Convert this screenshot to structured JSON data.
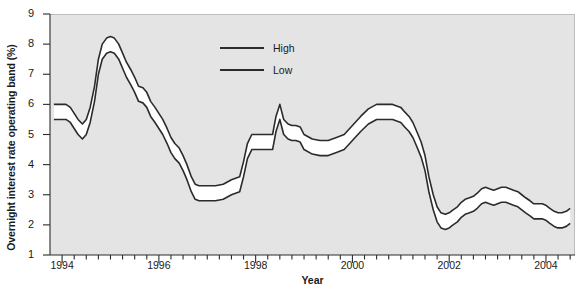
{
  "chart_data": {
    "type": "line",
    "title": "",
    "subtitle": "",
    "xlabel": "Year",
    "ylabel": "Overnight interest rate operating band (%)",
    "xlim": [
      1993.75,
      2004.6
    ],
    "ylim": [
      1,
      9
    ],
    "ytick_labels": [
      "9",
      "8",
      "7",
      "6",
      "5",
      "4",
      "3",
      "2",
      "1"
    ],
    "ytick_values": [
      9,
      8,
      7,
      6,
      5,
      4,
      3,
      2,
      1
    ],
    "xtick_labels": [
      "1994",
      "1996",
      "1998",
      "2000",
      "2002",
      "2004"
    ],
    "xtick_values": [
      1994,
      1996,
      1998,
      2000,
      2002,
      2004
    ],
    "minor_xtick_interval": 0.25,
    "grid": false,
    "legend_position": "upper-center-right",
    "band_fill": "#ffffff",
    "line_color": "#2b2b2b",
    "plot_background": "#e4e4e4",
    "legend": [
      {
        "name": "High",
        "label": "High"
      },
      {
        "name": "Low",
        "label": "Low"
      }
    ],
    "x": [
      1993.83,
      1994.0,
      1994.08,
      1994.17,
      1994.25,
      1994.33,
      1994.42,
      1994.5,
      1994.58,
      1994.67,
      1994.75,
      1994.83,
      1994.92,
      1995.0,
      1995.08,
      1995.17,
      1995.25,
      1995.33,
      1995.42,
      1995.5,
      1995.58,
      1995.67,
      1995.75,
      1995.83,
      1995.92,
      1996.0,
      1996.08,
      1996.17,
      1996.25,
      1996.33,
      1996.42,
      1996.5,
      1996.58,
      1996.67,
      1996.75,
      1996.83,
      1996.92,
      1997.0,
      1997.17,
      1997.33,
      1997.5,
      1997.67,
      1997.75,
      1997.83,
      1997.92,
      1998.0,
      1998.12,
      1998.2,
      1998.28,
      1998.35,
      1998.42,
      1998.5,
      1998.58,
      1998.67,
      1998.75,
      1998.83,
      1998.92,
      1999.0,
      1999.17,
      1999.33,
      1999.5,
      1999.67,
      1999.83,
      2000.0,
      2000.17,
      2000.33,
      2000.5,
      2000.67,
      2000.83,
      2001.0,
      2001.08,
      2001.17,
      2001.25,
      2001.33,
      2001.42,
      2001.5,
      2001.58,
      2001.67,
      2001.75,
      2001.83,
      2001.92,
      2002.0,
      2002.08,
      2002.17,
      2002.25,
      2002.33,
      2002.42,
      2002.5,
      2002.58,
      2002.67,
      2002.75,
      2002.83,
      2002.92,
      2003.0,
      2003.08,
      2003.17,
      2003.25,
      2003.33,
      2003.42,
      2003.5,
      2003.58,
      2003.67,
      2003.75,
      2003.83,
      2003.92,
      2004.0,
      2004.08,
      2004.17,
      2004.25,
      2004.33,
      2004.42,
      2004.5
    ],
    "series": [
      {
        "name": "High",
        "label": "High",
        "values": [
          6.0,
          6.0,
          6.0,
          5.9,
          5.7,
          5.5,
          5.35,
          5.5,
          5.9,
          6.6,
          7.5,
          8.0,
          8.2,
          8.25,
          8.2,
          8.0,
          7.7,
          7.4,
          7.15,
          6.9,
          6.6,
          6.55,
          6.4,
          6.1,
          5.9,
          5.7,
          5.5,
          5.2,
          4.9,
          4.7,
          4.55,
          4.3,
          4.0,
          3.6,
          3.35,
          3.3,
          3.3,
          3.3,
          3.3,
          3.35,
          3.5,
          3.6,
          4.1,
          4.7,
          5.0,
          5.0,
          5.0,
          5.0,
          5.0,
          5.0,
          5.6,
          6.0,
          5.5,
          5.35,
          5.3,
          5.3,
          5.25,
          5.0,
          4.85,
          4.8,
          4.8,
          4.9,
          5.0,
          5.3,
          5.6,
          5.85,
          6.0,
          6.0,
          6.0,
          5.9,
          5.75,
          5.6,
          5.4,
          5.1,
          4.75,
          4.3,
          3.6,
          3.0,
          2.6,
          2.4,
          2.35,
          2.4,
          2.5,
          2.6,
          2.75,
          2.85,
          2.9,
          2.95,
          3.05,
          3.2,
          3.25,
          3.2,
          3.15,
          3.2,
          3.25,
          3.25,
          3.2,
          3.15,
          3.1,
          3.0,
          2.9,
          2.8,
          2.7,
          2.7,
          2.7,
          2.65,
          2.55,
          2.45,
          2.4,
          2.4,
          2.45,
          2.55
        ]
      },
      {
        "name": "Low",
        "label": "Low",
        "values": [
          5.5,
          5.5,
          5.5,
          5.4,
          5.2,
          5.0,
          4.85,
          5.0,
          5.4,
          6.1,
          7.0,
          7.5,
          7.7,
          7.75,
          7.7,
          7.5,
          7.2,
          6.9,
          6.65,
          6.4,
          6.1,
          6.05,
          5.9,
          5.6,
          5.4,
          5.2,
          5.0,
          4.7,
          4.4,
          4.2,
          4.05,
          3.8,
          3.5,
          3.1,
          2.85,
          2.8,
          2.8,
          2.8,
          2.8,
          2.85,
          3.0,
          3.1,
          3.6,
          4.2,
          4.5,
          4.5,
          4.5,
          4.5,
          4.5,
          4.5,
          5.1,
          5.5,
          5.0,
          4.85,
          4.8,
          4.8,
          4.75,
          4.5,
          4.35,
          4.3,
          4.3,
          4.4,
          4.5,
          4.8,
          5.1,
          5.35,
          5.5,
          5.5,
          5.5,
          5.4,
          5.25,
          5.1,
          4.9,
          4.6,
          4.25,
          3.8,
          3.1,
          2.5,
          2.1,
          1.9,
          1.85,
          1.9,
          2.0,
          2.1,
          2.25,
          2.35,
          2.4,
          2.45,
          2.55,
          2.7,
          2.75,
          2.7,
          2.65,
          2.7,
          2.75,
          2.75,
          2.7,
          2.65,
          2.6,
          2.5,
          2.4,
          2.3,
          2.2,
          2.2,
          2.2,
          2.15,
          2.05,
          1.95,
          1.9,
          1.9,
          1.95,
          2.05
        ]
      }
    ]
  }
}
